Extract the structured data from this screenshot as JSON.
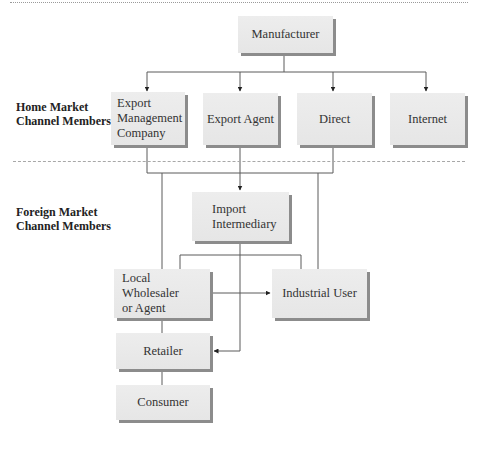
{
  "diagram": {
    "row_labels": {
      "home": "Home Market\nChannel Members",
      "home_line1": "Home Market",
      "home_line2": "Channel Members",
      "foreign_line1": "Foreign Market",
      "foreign_line2": "Channel Members"
    },
    "nodes": {
      "manufacturer": "Manufacturer",
      "emc_line1": "Export",
      "emc_line2": "Management",
      "emc_line3": "Company",
      "export_agent": "Export Agent",
      "direct": "Direct",
      "internet": "Internet",
      "import_line1": "Import",
      "import_line2": "Intermediary",
      "wholesaler_line1": "Local Wholesaler",
      "wholesaler_line2": "or Agent",
      "industrial_user": "Industrial User",
      "retailer": "Retailer",
      "consumer": "Consumer"
    },
    "edges": [
      {
        "from": "Manufacturer",
        "to": "Export Management Company"
      },
      {
        "from": "Manufacturer",
        "to": "Export Agent"
      },
      {
        "from": "Manufacturer",
        "to": "Direct"
      },
      {
        "from": "Manufacturer",
        "to": "Internet"
      },
      {
        "from": "Export Management Company / Export Agent / Direct",
        "to": "Import Intermediary"
      },
      {
        "from": "Export Management Company",
        "to": "Local Wholesaler or Agent"
      },
      {
        "from": "Direct",
        "to": "Industrial User"
      },
      {
        "from": "Import Intermediary",
        "to": "Local Wholesaler or Agent"
      },
      {
        "from": "Import Intermediary",
        "to": "Industrial User"
      },
      {
        "from": "Import Intermediary",
        "to": "Retailer"
      },
      {
        "from": "Local Wholesaler or Agent",
        "to": "Industrial User"
      },
      {
        "from": "Local Wholesaler or Agent",
        "to": "Retailer"
      },
      {
        "from": "Retailer",
        "to": "Consumer"
      }
    ],
    "colors": {
      "box_fill": "#e9e9e9",
      "box_shadow": "#8c8c8c",
      "line": "#555555",
      "divider": "#a8a8a8"
    }
  }
}
